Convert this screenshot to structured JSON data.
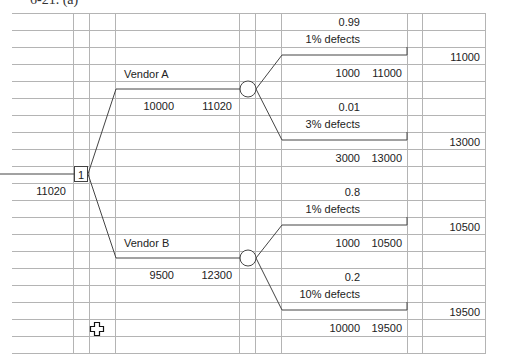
{
  "caption": "6-21. (a)",
  "decision_node": {
    "label": "1",
    "value": "11020"
  },
  "branches": [
    {
      "name": "Vendor A",
      "cost": "10000",
      "expected_value": "11020",
      "outcomes": [
        {
          "probability": "0.99",
          "label": "1% defects",
          "cost": "1000",
          "cumulative": "11000",
          "terminal": "11000"
        },
        {
          "probability": "0.01",
          "label": "3% defects",
          "cost": "3000",
          "cumulative": "13000",
          "terminal": "13000"
        }
      ]
    },
    {
      "name": "Vendor B",
      "cost": "9500",
      "expected_value": "12300",
      "outcomes": [
        {
          "probability": "0.8",
          "label": "1% defects",
          "cost": "1000",
          "cumulative": "10500",
          "terminal": "10500"
        },
        {
          "probability": "0.2",
          "label": "10% defects",
          "cost": "10000",
          "cumulative": "19500",
          "terminal": "19500"
        }
      ]
    }
  ],
  "colors": {
    "grid": "#b4b4b4",
    "tree_line": "#444444",
    "text": "#222222"
  },
  "cursor_icon": "crosshair-plus-cursor"
}
